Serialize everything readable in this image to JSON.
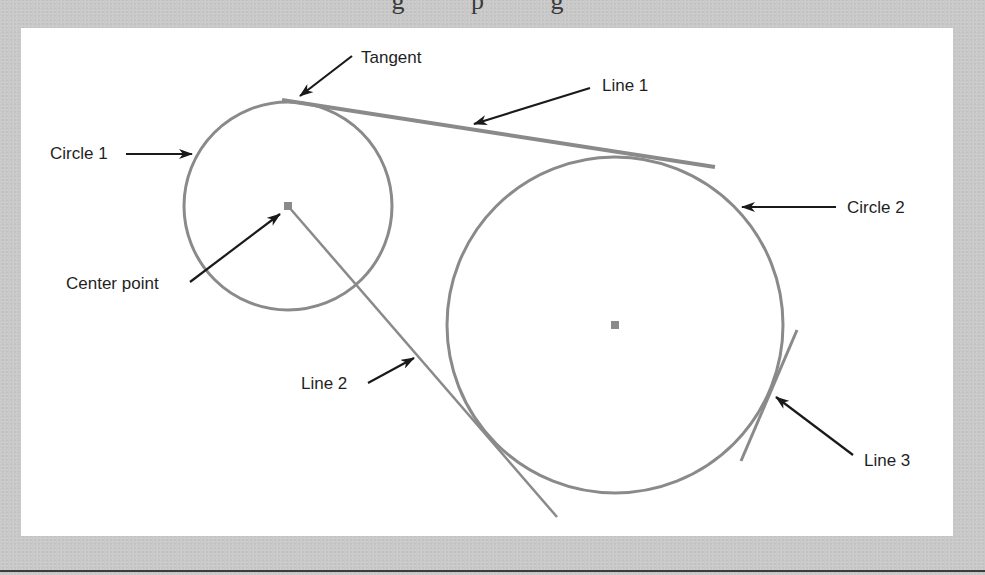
{
  "page": {
    "top_text_fragment": "g  p g"
  },
  "diagram": {
    "colors": {
      "geometry": "#8a8a8a",
      "arrow": "#1a1a1a",
      "panel": "#ffffff",
      "background": "#c9c9c9"
    },
    "labels": {
      "tangent": "Tangent",
      "line1": "Line 1",
      "circle1": "Circle 1",
      "circle2": "Circle 2",
      "center_point": "Center point",
      "line2": "Line 2",
      "line3": "Line 3"
    },
    "shapes": {
      "circle1": {
        "cx": 288,
        "cy": 206,
        "r": 104
      },
      "circle2": {
        "cx": 615,
        "cy": 325,
        "r": 168
      },
      "line1": {
        "x1": 282,
        "y1": 100,
        "x2": 715,
        "y2": 167
      },
      "line2": {
        "x1": 288,
        "y1": 206,
        "x2": 557,
        "y2": 517
      },
      "line3": {
        "x1": 797,
        "y1": 330,
        "x2": 741,
        "y2": 461
      },
      "center_point_1": {
        "x": 288,
        "y": 206
      },
      "center_point_2": {
        "x": 615,
        "y": 325
      }
    }
  }
}
